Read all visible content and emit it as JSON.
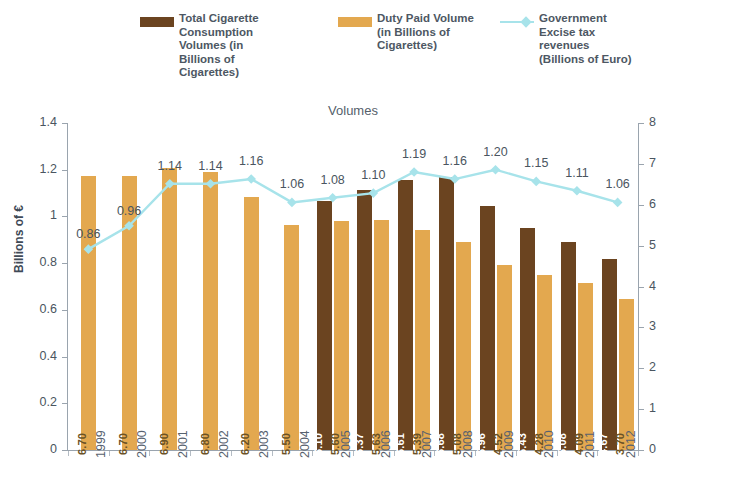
{
  "chart_title": "Volumes",
  "legend": [
    {
      "key": "total",
      "label": "Total Cigarette\nConsumption\nVolumes (in\nBillions of\nCigarettes)",
      "color": "#6b4420",
      "marker": "bar-swatch-icon"
    },
    {
      "key": "duty",
      "label": "Duty Paid Volume\n(in Billions of\nCigarettes)",
      "color": "#e3a84f",
      "marker": "bar-swatch-icon"
    },
    {
      "key": "gov",
      "label": "Government\nExcise tax\nrevenues\n(Billions of Euro)",
      "color": "#a7e3ea",
      "marker": "line-swatch-icon"
    }
  ],
  "axes": {
    "left_title": "Billions of  €",
    "right_title": "Billions of Cigarettes",
    "left_ticks": [
      "0",
      "0.2",
      "0.4",
      "0.6",
      "0.8",
      "1",
      "1.2",
      "1.4"
    ],
    "right_ticks": [
      "0",
      "1",
      "2",
      "3",
      "4",
      "5",
      "6",
      "7",
      "8"
    ],
    "left_min": 0,
    "left_max": 1.4,
    "right_min": 0,
    "right_max": 8
  },
  "chart_data": {
    "type": "bar",
    "title": "Volumes",
    "xlabel": "",
    "ylabel": "Billions of  €",
    "y2label": "Billions of Cigarettes",
    "ylim": [
      0,
      1.4
    ],
    "y2lim": [
      0,
      8
    ],
    "grid": false,
    "legend_position": "top",
    "categories": [
      "1999",
      "2000",
      "2001",
      "2002",
      "2003",
      "2004",
      "2005",
      "2006",
      "2007",
      "2008",
      "2009",
      "2010",
      "2011",
      "2012"
    ],
    "series": [
      {
        "name": "Total Cigarette Consumption Volumes (in Billions of Cigarettes)",
        "type": "bar",
        "axis": "right",
        "color": "#6b4420",
        "values": [
          null,
          null,
          null,
          null,
          null,
          null,
          6.1,
          6.37,
          6.61,
          6.68,
          5.96,
          5.43,
          5.08,
          4.67
        ],
        "labels": [
          "",
          "",
          "",
          "",
          "",
          "",
          "6.10",
          "6.37",
          "6.61",
          "6.68",
          "5.96",
          "5.43",
          "5.08",
          "4.67"
        ]
      },
      {
        "name": "Duty Paid Volume (in Billions of Cigarettes)",
        "type": "bar",
        "axis": "right",
        "color": "#e3a84f",
        "values": [
          6.7,
          6.7,
          6.9,
          6.8,
          6.2,
          5.5,
          5.6,
          5.63,
          5.39,
          5.08,
          4.52,
          4.28,
          4.09,
          3.7
        ],
        "labels": [
          "6.70",
          "6.70",
          "6.90",
          "6.80",
          "6.20",
          "5.50",
          "5.60",
          "5.63",
          "5.39",
          "5.08",
          "4.52",
          "4.28",
          "4.09",
          "3.70"
        ]
      },
      {
        "name": "Government Excise tax revenues (Billions of Euro)",
        "type": "line",
        "axis": "left",
        "color": "#a7e3ea",
        "values": [
          0.86,
          0.96,
          1.14,
          1.14,
          1.16,
          1.06,
          1.08,
          1.1,
          1.19,
          1.16,
          1.2,
          1.15,
          1.11,
          1.06
        ],
        "labels": [
          "0.86",
          "0.96",
          "1.14",
          "1.14",
          "1.16",
          "1.06",
          "1.08",
          "1.10",
          "1.19",
          "1.16",
          "1.20",
          "1.15",
          "1.11",
          "1.06"
        ]
      }
    ]
  }
}
